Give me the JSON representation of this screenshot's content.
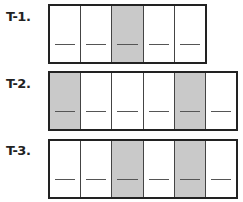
{
  "problems": [
    {
      "label": "T-1.",
      "cells": [
        false,
        false,
        true,
        false,
        false
      ]
    },
    {
      "label": "T-2.",
      "cells": [
        true,
        false,
        false,
        false,
        true,
        false
      ]
    },
    {
      "label": "T-3.",
      "cells": [
        false,
        false,
        true,
        false,
        true,
        false
      ]
    }
  ],
  "colors": {
    "shaded": "#c9c9c9",
    "border": "#222222",
    "background": "#ffffff"
  }
}
